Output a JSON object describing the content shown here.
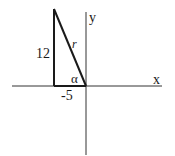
{
  "diagram": {
    "type": "reference-triangle",
    "axes": {
      "x_label": "x",
      "y_label": "y"
    },
    "triangle": {
      "vertical_leg_label": "12",
      "horizontal_leg_label": "-5",
      "hypotenuse_label": "r",
      "angle_label": "α"
    },
    "colors": {
      "line": "#1a1a1a",
      "axis": "#333333",
      "background": "#ffffff"
    }
  }
}
